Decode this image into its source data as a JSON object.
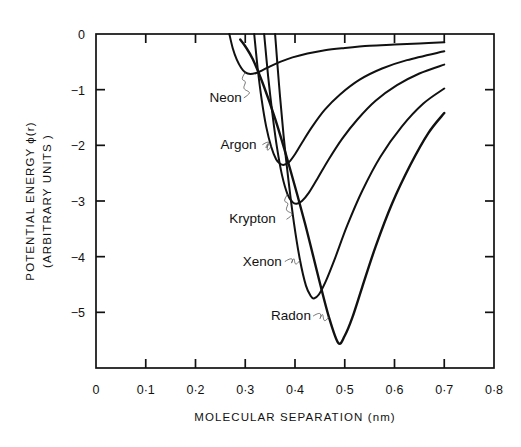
{
  "chart_data": {
    "type": "line",
    "title": "",
    "xlabel": "MOLECULAR  SEPARATION (nm)",
    "ylabel_line1": "POTENTIAL  ENERGY  ϕ(r)",
    "ylabel_line2": "(ARBITRARY  UNITS )",
    "xlim": [
      0,
      0.8
    ],
    "ylim": [
      -6,
      0
    ],
    "grid": false,
    "legend_position": "inline-annotations",
    "xticks": [
      0,
      0.1,
      0.2,
      0.3,
      0.4,
      0.5,
      0.6,
      0.7,
      0.8
    ],
    "xtick_labels": [
      "0",
      "0·1",
      "0·2",
      "0·3",
      "0·4",
      "0·5",
      "0·6",
      "0·7",
      "0·8"
    ],
    "yticks": [
      0,
      -1,
      -2,
      -3,
      -4,
      -5
    ],
    "ytick_labels": [
      "0",
      "−1",
      "−2",
      "−3",
      "−4",
      "−5"
    ],
    "series": [
      {
        "name": "Neon",
        "minimum_x": 0.31,
        "minimum_y": -0.72,
        "x": [
          0.268,
          0.275,
          0.283,
          0.292,
          0.3,
          0.31,
          0.322,
          0.335,
          0.35,
          0.37,
          0.395,
          0.425,
          0.46,
          0.5,
          0.55,
          0.6,
          0.65,
          0.7
        ],
        "y": [
          0.0,
          -0.26,
          -0.46,
          -0.61,
          -0.69,
          -0.72,
          -0.7,
          -0.65,
          -0.58,
          -0.5,
          -0.42,
          -0.35,
          -0.29,
          -0.25,
          -0.21,
          -0.19,
          -0.17,
          -0.15
        ]
      },
      {
        "name": "Argon",
        "minimum_x": 0.378,
        "minimum_y": -2.35,
        "x": [
          0.318,
          0.325,
          0.333,
          0.342,
          0.352,
          0.362,
          0.37,
          0.378,
          0.388,
          0.4,
          0.415,
          0.435,
          0.46,
          0.49,
          0.53,
          0.575,
          0.625,
          0.7
        ],
        "y": [
          0.0,
          -0.62,
          -1.18,
          -1.66,
          -2.02,
          -2.25,
          -2.33,
          -2.35,
          -2.3,
          -2.16,
          -1.94,
          -1.66,
          -1.36,
          -1.09,
          -0.82,
          -0.62,
          -0.47,
          -0.31
        ]
      },
      {
        "name": "Krypton",
        "minimum_x": 0.403,
        "minimum_y": -3.05,
        "x": [
          0.338,
          0.346,
          0.355,
          0.364,
          0.374,
          0.385,
          0.395,
          0.403,
          0.414,
          0.428,
          0.445,
          0.468,
          0.495,
          0.525,
          0.562,
          0.605,
          0.65,
          0.7
        ],
        "y": [
          0.0,
          -0.76,
          -1.46,
          -2.05,
          -2.54,
          -2.88,
          -3.02,
          -3.05,
          -3.0,
          -2.85,
          -2.6,
          -2.25,
          -1.88,
          -1.54,
          -1.2,
          -0.92,
          -0.71,
          -0.55
        ]
      },
      {
        "name": "Xenon",
        "minimum_x": 0.438,
        "minimum_y": -4.75,
        "x": [
          0.36,
          0.368,
          0.377,
          0.387,
          0.398,
          0.41,
          0.422,
          0.432,
          0.438,
          0.448,
          0.462,
          0.48,
          0.505,
          0.535,
          0.572,
          0.615,
          0.658,
          0.7
        ],
        "y": [
          0.0,
          -0.92,
          -1.82,
          -2.64,
          -3.4,
          -4.06,
          -4.52,
          -4.71,
          -4.75,
          -4.68,
          -4.44,
          -4.04,
          -3.44,
          -2.82,
          -2.2,
          -1.66,
          -1.25,
          -0.98
        ]
      },
      {
        "name": "Radon",
        "minimum_x": 0.487,
        "minimum_y": -5.55,
        "x": [
          0.29,
          0.3,
          0.315,
          0.335,
          0.36,
          0.39,
          0.42,
          0.448,
          0.468,
          0.487,
          0.5,
          0.515,
          0.535,
          0.562,
          0.595,
          0.632,
          0.668,
          0.7
        ],
        "y": [
          -0.1,
          -0.22,
          -0.45,
          -0.88,
          -1.52,
          -2.42,
          -3.4,
          -4.4,
          -5.08,
          -5.55,
          -5.42,
          -5.1,
          -4.55,
          -3.82,
          -3.05,
          -2.35,
          -1.78,
          -1.42
        ]
      }
    ],
    "annotations": [
      {
        "label": "Neon",
        "x": 0.228,
        "y": -1.22
      },
      {
        "label": "Argon",
        "x": 0.25,
        "y": -2.06
      },
      {
        "label": "Krypton",
        "x": 0.268,
        "y": -3.4
      },
      {
        "label": "Xenon",
        "x": 0.295,
        "y": -4.16
      },
      {
        "label": "Radon",
        "x": 0.352,
        "y": -5.14
      }
    ]
  },
  "style": {
    "curve_color": "#111111",
    "axis_color": "#111111",
    "background": "#ffffff"
  }
}
